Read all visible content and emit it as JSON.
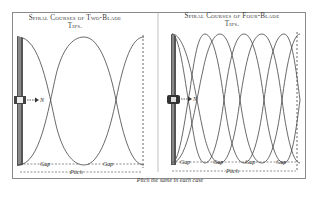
{
  "panels": [
    {
      "title_line1": "Spiral Courses of Two-Blade",
      "title_line2": "Tips.",
      "blades": 2,
      "direction_label": "N",
      "gap_labels": [
        "Gap",
        "Gap"
      ],
      "pitch_label": "Pitch"
    },
    {
      "title_line1": "Spiral Courses of Four-Blade",
      "title_line2": "Tips.",
      "blades": 4,
      "direction_label": "N",
      "gap_labels": [
        "Gap",
        "Gap",
        "Gap",
        "Gap"
      ],
      "pitch_label": "Pitch"
    }
  ],
  "caption": "Pitch the same in each case",
  "colors": {
    "line": "#444444",
    "frame": "#8a8a8a",
    "background": "#ffffff"
  }
}
